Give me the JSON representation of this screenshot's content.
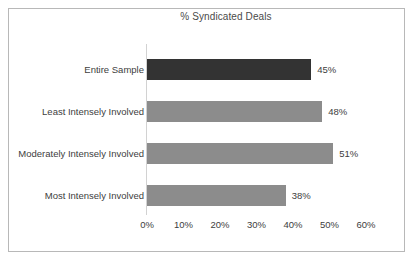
{
  "chart_data": {
    "type": "bar",
    "orientation": "horizontal",
    "title": "% Syndicated Deals",
    "xlabel": "",
    "ylabel": "",
    "xlim": [
      0,
      60
    ],
    "grid": false,
    "legend": false,
    "categories": [
      "Entire Sample",
      "Least Intensely Involved",
      "Moderately Intensely Involved",
      "Most Intensely Involved"
    ],
    "values": [
      45,
      48,
      51,
      38
    ],
    "value_labels": [
      "45%",
      "48%",
      "51%",
      "38%"
    ],
    "bar_colors": [
      "#333333",
      "#8c8c8c",
      "#8c8c8c",
      "#8c8c8c"
    ],
    "xticks": [
      0,
      10,
      20,
      30,
      40,
      50,
      60
    ],
    "xtick_labels": [
      "0%",
      "10%",
      "20%",
      "30%",
      "40%",
      "50%",
      "60%"
    ]
  },
  "style": {
    "border_color": "#b8b8b8",
    "axis_color": "#d2d2d2",
    "text_color": "#404040",
    "title_color": "#4a4a4a",
    "background": "#ffffff"
  }
}
